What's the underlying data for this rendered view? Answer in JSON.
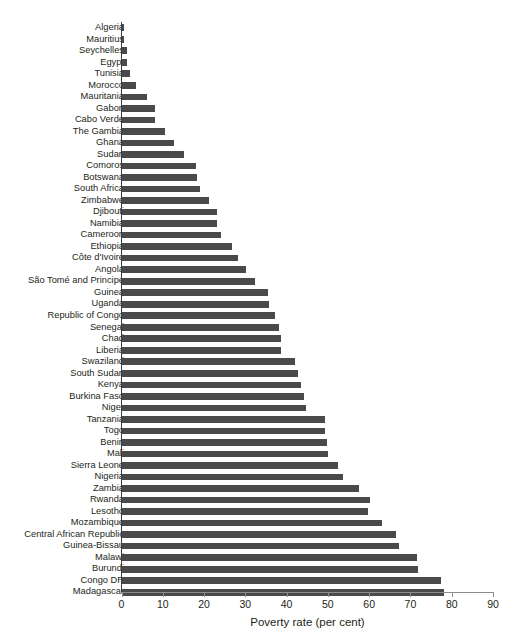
{
  "chart_data": {
    "type": "bar",
    "orientation": "horizontal",
    "title": "",
    "subtitle": "",
    "xlabel": "Poverty rate (per cent)",
    "ylabel": "",
    "xlim": [
      0,
      90
    ],
    "xticks": [
      0,
      10,
      20,
      30,
      40,
      50,
      60,
      70,
      80,
      90
    ],
    "grid": false,
    "legend": null,
    "bar_color": "#4a4a4a",
    "axis_color": "#8c8c8c",
    "text_color": "#231f20",
    "categories": [
      "Algeria",
      "Mauritius",
      "Seychelles",
      "Egypt",
      "Tunisia",
      "Morocco",
      "Mauritania",
      "Gabon",
      "Cabo Verde",
      "The Gambia",
      "Ghana",
      "Sudan",
      "Comoros",
      "Botswana",
      "South Africa",
      "Zimbabwe",
      "Djibouti",
      "Namibia",
      "Cameroon",
      "Ethiopia",
      "Côte d'Ivoire",
      "Angola",
      "São Tomé and Principe",
      "Guinea",
      "Uganda",
      "Republic of Congo",
      "Senegal",
      "Chad",
      "Liberia",
      "Swaziland",
      "South Sudan",
      "Kenya",
      "Burkina Faso",
      "Niger",
      "Tanzania",
      "Togo",
      "Benin",
      "Mali",
      "Sierra Leone",
      "Nigeria",
      "Zambia",
      "Rwanda",
      "Lesotho",
      "Mozambique",
      "Central African Republic",
      "Guinea-Bissau",
      "Malawi",
      "Burundi",
      "Congo DR",
      "Madagascar"
    ],
    "values": [
      0.5,
      0.6,
      1.1,
      1.3,
      2.0,
      3.4,
      6.0,
      8.0,
      8.1,
      10.4,
      12.6,
      14.9,
      18.0,
      18.2,
      18.9,
      21.0,
      22.9,
      23.0,
      24.0,
      26.7,
      28.2,
      30.1,
      32.3,
      35.3,
      35.7,
      37.0,
      38.0,
      38.4,
      38.6,
      42.0,
      42.7,
      43.4,
      44.0,
      44.5,
      49.1,
      49.2,
      49.6,
      49.8,
      52.3,
      53.5,
      57.5,
      60.0,
      59.7,
      62.9,
      66.3,
      67.1,
      71.4,
      71.8,
      77.2,
      78.0
    ]
  }
}
